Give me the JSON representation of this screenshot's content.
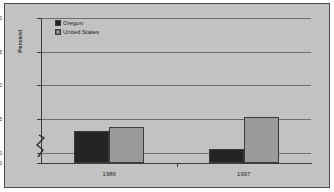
{
  "chart_data": {
    "type": "bar",
    "title": "",
    "subtitle": "",
    "xlabel": "",
    "ylabel": "Percent",
    "categories": [
      "1989",
      "1997"
    ],
    "series": [
      {
        "name": "Oregon",
        "values": [
          63.2,
          60.6
        ],
        "color": "#242424"
      },
      {
        "name": "United States",
        "values": [
          63.8,
          65.3
        ],
        "color": "#9b9b9b"
      }
    ],
    "ylim": [
      0,
      80
    ],
    "yticks": [
      0,
      60,
      65,
      70,
      75,
      80
    ],
    "ytick_labels": [
      "0",
      "60",
      "65",
      "70",
      "75",
      "80"
    ],
    "y_axis_break": true,
    "y_axis_break_between": [
      0,
      60
    ],
    "grid": true,
    "grid_axis": "y",
    "legend_position": "top-left-inside",
    "plot_background": "#c2c2c2",
    "gridline_color": "#6e6e6e",
    "axis_color": "#3d3d3d",
    "border_color": "#4a4a4a"
  },
  "axis": {
    "y_title": "Percent"
  },
  "legend": {
    "items": [
      {
        "label": "Oregon"
      },
      {
        "label": "United States"
      }
    ]
  }
}
